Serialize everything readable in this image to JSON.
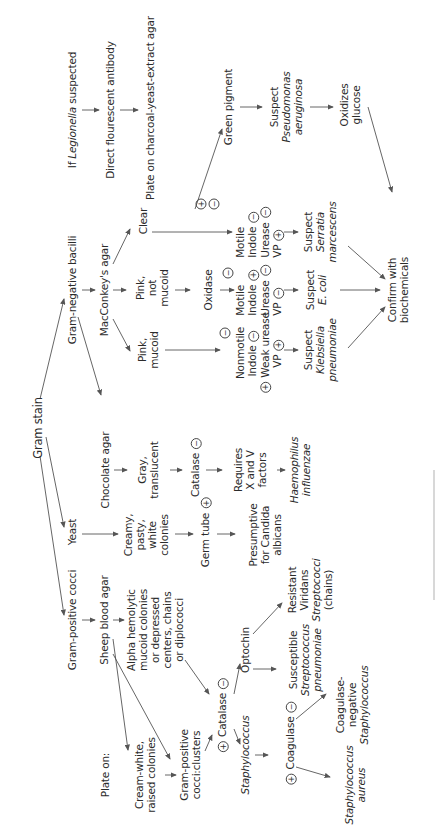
{
  "diagram": {
    "title": "Gram stain",
    "legionella": {
      "suspected": [
        "If ",
        "Legionella",
        " suspected"
      ],
      "dfa": "Direct flourescent antibody",
      "plate": "Plate on charcoal-yeast-extract agar"
    },
    "gram_negative": {
      "label": "Gram-negative bacilli",
      "medium": "MacConkey's agar",
      "clear": "Clear",
      "pink_not_mucoid": [
        "Pink,",
        "not",
        "mucoid"
      ],
      "pink_mucoid": [
        "Pink,",
        "mucoid"
      ],
      "oxidase": "Oxidase",
      "clear_oxidase_pos": "+",
      "clear_oxidase_neg": "−",
      "green_pigment": "Green pigment",
      "pseudomonas": [
        "Suspect",
        "Pseudomonas",
        "aeruginosa"
      ],
      "oxidizes": [
        "Oxidizes",
        "glucose"
      ],
      "serratia_tests": [
        {
          "label": "Motile",
          "sign": ""
        },
        {
          "label": "Indole",
          "sign": "−"
        },
        {
          "label": "Urease",
          "sign": "−"
        },
        {
          "label": "VP",
          "sign": "+"
        }
      ],
      "ecoli_oxidase_sign": "−",
      "ecoli_tests": [
        {
          "label": "Motile",
          "sign": ""
        },
        {
          "label": "Indole",
          "sign": "+"
        },
        {
          "label": "Urease",
          "sign": "−"
        },
        {
          "label": "VP",
          "sign": "−"
        }
      ],
      "kleb_oxidase_sign": "−",
      "kleb_tests": [
        {
          "label": "Nonmotile",
          "sign": "",
          "pre": ""
        },
        {
          "label": "Indole",
          "sign": "−",
          "pre": ""
        },
        {
          "label": "Weak urease",
          "sign": "",
          "pre": "+"
        },
        {
          "label": "VP",
          "sign": "+",
          "pre": ""
        }
      ],
      "serratia": [
        "Suspect",
        "Serratia",
        "marcescens"
      ],
      "ecoli": [
        "Suspect",
        "E. coli"
      ],
      "klebsiella": [
        "Suspect",
        "Klebsiella",
        "pneumoniae"
      ],
      "confirm": [
        "Confirm with",
        "biochemicals"
      ]
    },
    "chocolate": {
      "medium": "Chocolate agar",
      "colonies": [
        "Gray,",
        "translucent"
      ],
      "catalase": "Catalase",
      "catalase_sign": "−",
      "requires": [
        "Requires",
        "X and V",
        "factors"
      ],
      "result": [
        "Haemophilus",
        "influenzae"
      ]
    },
    "yeast": {
      "label": "Yeast",
      "colonies": [
        "Creamy,",
        "pasty,",
        "white",
        "colonies"
      ],
      "germ_tube": "Germ tube",
      "germ_tube_sign": "+",
      "result": [
        "Presumptive",
        "for Candida",
        "albicans"
      ]
    },
    "gram_positive": {
      "label": "Gram-positive cocci",
      "medium": "Sheep blood agar",
      "alpha": [
        "Alpha hemolytic",
        "mucoid colonies",
        "or depressed",
        "centers, chains",
        "or diplococci"
      ],
      "plate_on": "Plate on:",
      "cream_white": [
        "Cream-white,",
        "raised colonies"
      ],
      "clusters": [
        "Gram-positive",
        "cocci:clusters"
      ],
      "catalase": "Catalase",
      "catalase_pos": "+",
      "catalase_neg": "−",
      "optochin": "Optochin",
      "susceptible": [
        "Susceptible",
        "Streptococcus",
        "pneumoniae"
      ],
      "resistant": [
        "Resistant",
        "Viridans",
        "Streptococci",
        "(chains)"
      ],
      "staph": "Staphylococcus",
      "coagulase": "Coagulase",
      "coagulase_pos": "+",
      "coagulase_neg": "−",
      "aureus": [
        "Staphylococcus",
        "aureus"
      ],
      "coag_neg": [
        "Coagulase-",
        "negative",
        "Staphylococcus"
      ]
    }
  }
}
